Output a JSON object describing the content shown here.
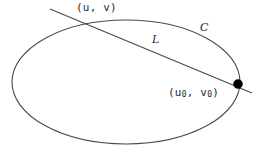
{
  "figure": {
    "background_color": "#ffffff",
    "stroke_color": "#4a4a4a",
    "point_color": "#000000",
    "text_color": "#2b2b2b"
  },
  "labels": {
    "point_uv": "(u, v)",
    "point_u0v0_prefix": "(u",
    "point_u0v0_sub1": "0",
    "point_u0v0_mid": ", v",
    "point_u0v0_sub2": "0",
    "point_u0v0_suffix": ")",
    "curve_c": "C",
    "line_l": "L"
  },
  "geometry": {
    "ellipse": {
      "cx": 126,
      "cy": 82,
      "rx": 114,
      "ry": 62
    },
    "line": {
      "x1": 50,
      "y1": 9,
      "x2": 252,
      "y2": 93
    },
    "marked_point": {
      "cx": 238,
      "cy": 84,
      "r": 4.5
    },
    "intersection_top": {
      "cx": 88,
      "cy": 24
    }
  }
}
